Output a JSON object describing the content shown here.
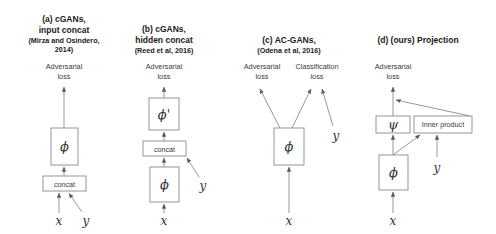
{
  "figure": {
    "name": "conditional-gan-discriminator-architectures",
    "background_color": "#ffffff",
    "line_color": "#8c8c8c",
    "text_color": "#333333"
  },
  "panels": [
    {
      "id": "a",
      "title": "(a) cGANs,",
      "title2": "input concat",
      "citation": "(Mirza and Osindero,",
      "citation2": "2014)",
      "losses": [
        {
          "line1": "Adversarial",
          "line2": "loss"
        }
      ],
      "boxes": [
        {
          "label": "ϕ",
          "kind": "greek"
        },
        {
          "label": "concat",
          "kind": "text"
        }
      ],
      "inputs": [
        "x",
        "y"
      ]
    },
    {
      "id": "b",
      "title": "(b) cGANs,",
      "title2": "hidden concat",
      "citation": "(Reed et al, 2016)",
      "citation2": "",
      "losses": [
        {
          "line1": "Adversarial",
          "line2": "loss"
        }
      ],
      "boxes": [
        {
          "label": "ϕ'",
          "kind": "greek"
        },
        {
          "label": "concat",
          "kind": "text"
        },
        {
          "label": "ϕ",
          "kind": "greek"
        }
      ],
      "inputs": [
        "x",
        "y"
      ]
    },
    {
      "id": "c",
      "title": "(c) AC-GANs,",
      "title2": "",
      "citation": "(Odena et al, 2016)",
      "citation2": "",
      "losses": [
        {
          "line1": "Adversarial",
          "line2": "loss"
        },
        {
          "line1": "Classification",
          "line2": "loss"
        }
      ],
      "boxes": [
        {
          "label": "ϕ",
          "kind": "greek"
        }
      ],
      "inputs": [
        "x",
        "y"
      ]
    },
    {
      "id": "d",
      "title": "(d) (ours) Projection",
      "title2": "",
      "citation": "",
      "citation2": "",
      "losses": [
        {
          "line1": "Adversarial",
          "line2": "loss"
        }
      ],
      "boxes": [
        {
          "label": "ψ",
          "kind": "greek"
        },
        {
          "label": "Inner product",
          "kind": "text"
        },
        {
          "label": "ϕ",
          "kind": "greek"
        }
      ],
      "inputs": [
        "x",
        "y"
      ]
    }
  ]
}
